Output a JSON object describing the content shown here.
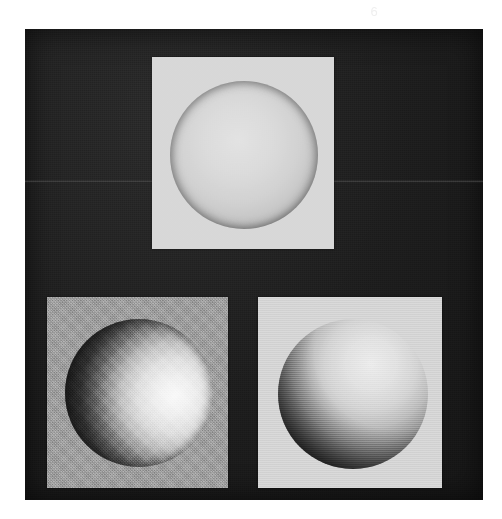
{
  "figure": {
    "caption": "",
    "scan_mark": "6",
    "background_color": "#ffffff",
    "plate_color": "#1c1c1c"
  },
  "panels": [
    {
      "id": "panel-top",
      "position": "top-center",
      "background_color": "#d8d8d8",
      "label": "",
      "sphere": {
        "name": "sphere-frontal-illumination",
        "base_color": "#d2d2d2",
        "highlight_color": "#e6e6e6",
        "shadow_color": "#6e6e6e",
        "light_direction": "front",
        "light_azimuth_deg": 0,
        "light_elevation_deg": 90,
        "description": "sphere lit head-on, nearly flat appearance with dark limb"
      }
    },
    {
      "id": "panel-bottom-left",
      "position": "bottom-left",
      "background_color": "#9e9e9e",
      "label": "",
      "sphere": {
        "name": "sphere-side-illumination-right",
        "base_color": "#c8c8c8",
        "highlight_color": "#f2f2f2",
        "shadow_color": "#141414",
        "light_direction": "right",
        "light_azimuth_deg": 0,
        "light_elevation_deg": 0,
        "description": "sphere lit from the right, vertical terminator, left half in shadow"
      }
    },
    {
      "id": "panel-bottom-right",
      "position": "bottom-right",
      "background_color": "#d6d6d6",
      "label": "",
      "sphere": {
        "name": "sphere-oblique-illumination-upper-right",
        "base_color": "#cfcfcf",
        "highlight_color": "#ececec",
        "shadow_color": "#1a1a1a",
        "light_direction": "upper-right",
        "light_azimuth_deg": 45,
        "light_elevation_deg": 35,
        "description": "sphere lit from the upper right, crescent shadow on lower left"
      }
    }
  ]
}
